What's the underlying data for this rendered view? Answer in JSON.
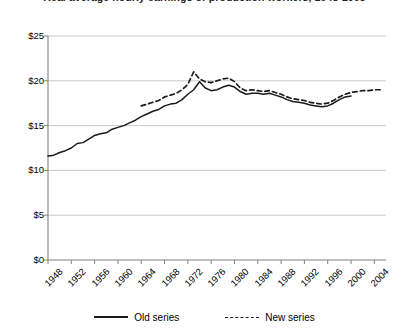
{
  "chart_data": {
    "type": "line",
    "title": "Real average hourly earnings of production workers, 1948-2005",
    "xlabel": "",
    "ylabel": "",
    "xlim": [
      1948,
      2006
    ],
    "ylim": [
      0,
      25
    ],
    "grid": true,
    "legend_position": "bottom",
    "y_ticks": [
      0,
      5,
      10,
      15,
      20,
      25
    ],
    "y_tick_labels": [
      "$0",
      "$5",
      "$10",
      "$15",
      "$20",
      "$25"
    ],
    "x_ticks": [
      1948,
      1952,
      1956,
      1960,
      1964,
      1968,
      1972,
      1976,
      1980,
      1984,
      1988,
      1992,
      1996,
      2000,
      2004
    ],
    "x_tick_labels": [
      "1948",
      "1952",
      "1956",
      "1960",
      "1964",
      "1968",
      "1972",
      "1976",
      "1980",
      "1984",
      "1988",
      "1992",
      "1996",
      "2000",
      "2004"
    ],
    "series": [
      {
        "name": "Old series",
        "style": "solid",
        "color": "#1a1a1a",
        "x": [
          1948,
          1949,
          1950,
          1951,
          1952,
          1953,
          1954,
          1955,
          1956,
          1957,
          1958,
          1959,
          1960,
          1961,
          1962,
          1963,
          1964,
          1965,
          1966,
          1967,
          1968,
          1969,
          1970,
          1971,
          1972,
          1973,
          1974,
          1975,
          1976,
          1977,
          1978,
          1979,
          1980,
          1981,
          1982,
          1983,
          1984,
          1985,
          1986,
          1987,
          1988,
          1989,
          1990,
          1991,
          1992,
          1993,
          1994,
          1995,
          1996,
          1997,
          1998,
          1999,
          2000
        ],
        "values": [
          11.6,
          11.7,
          12.0,
          12.2,
          12.5,
          13.0,
          13.1,
          13.5,
          13.9,
          14.1,
          14.2,
          14.6,
          14.8,
          15.0,
          15.3,
          15.6,
          16.0,
          16.3,
          16.6,
          16.8,
          17.2,
          17.4,
          17.5,
          17.9,
          18.5,
          19.0,
          19.9,
          19.2,
          18.9,
          19.0,
          19.3,
          19.5,
          19.3,
          18.8,
          18.5,
          18.6,
          18.6,
          18.5,
          18.6,
          18.4,
          18.2,
          17.9,
          17.7,
          17.6,
          17.5,
          17.3,
          17.2,
          17.1,
          17.2,
          17.5,
          17.9,
          18.2,
          18.3
        ]
      },
      {
        "name": "New series",
        "style": "dashed",
        "color": "#1a1a1a",
        "x": [
          1964,
          1965,
          1966,
          1967,
          1968,
          1969,
          1970,
          1971,
          1972,
          1973,
          1974,
          1975,
          1976,
          1977,
          1978,
          1979,
          1980,
          1981,
          1982,
          1983,
          1984,
          1985,
          1986,
          1987,
          1988,
          1989,
          1990,
          1991,
          1992,
          1993,
          1994,
          1995,
          1996,
          1997,
          1998,
          1999,
          2000,
          2001,
          2002,
          2003,
          2004,
          2005
        ],
        "values": [
          17.2,
          17.4,
          17.6,
          17.8,
          18.2,
          18.4,
          18.6,
          19.0,
          19.6,
          21.0,
          20.2,
          19.9,
          19.8,
          20.0,
          20.2,
          20.3,
          19.9,
          19.2,
          18.9,
          19.0,
          18.9,
          18.8,
          18.9,
          18.7,
          18.5,
          18.2,
          18.0,
          17.9,
          17.8,
          17.6,
          17.5,
          17.4,
          17.5,
          17.8,
          18.2,
          18.5,
          18.7,
          18.8,
          18.9,
          18.9,
          19.0,
          19.0
        ]
      }
    ]
  },
  "legend": {
    "old_label": "Old series",
    "new_label": "New series"
  }
}
